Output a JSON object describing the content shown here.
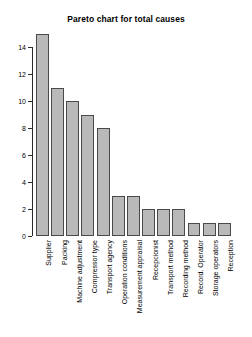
{
  "chart_data": {
    "type": "bar",
    "title": "Pareto chart for total causes",
    "xlabel": "",
    "ylabel": "",
    "categories": [
      "Supplier",
      "Packing",
      "Machine adjustment",
      "Compressor type",
      "Transport agency",
      "Operation conditions",
      "Measurement appraisal",
      "Recepcionist",
      "Transport method",
      "Recording method",
      "Record. Operator",
      "Storage operators",
      "Reception"
    ],
    "values": [
      15,
      11,
      10,
      9,
      8,
      3,
      3,
      2,
      2,
      2,
      1,
      1,
      1
    ],
    "ylim": [
      0,
      15
    ],
    "yticks": [
      0,
      2,
      4,
      6,
      8,
      10,
      12,
      14
    ],
    "ytick_labels": [
      "0",
      "2",
      "4",
      "6",
      "8",
      "10",
      "12",
      "14"
    ],
    "grid": false,
    "legend": false,
    "bar_fill": "#b9b9b9",
    "bar_border": "#4a4a4a",
    "axis_color": "#2b2b2b",
    "background": "#ffffff"
  }
}
